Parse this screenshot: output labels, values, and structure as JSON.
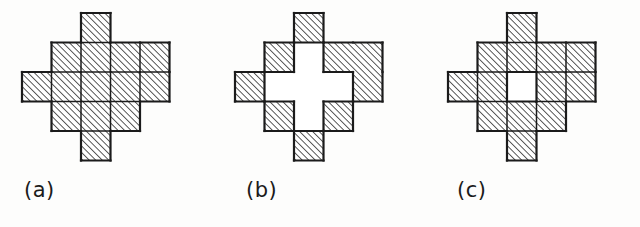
{
  "page": {
    "background_color": "#fdfdfc",
    "ink_color": "#1b1b1b",
    "hatch_color": "#2a2a2a",
    "fill_color": "#ffffff",
    "width": 640,
    "height": 227
  },
  "figure": {
    "grid": {
      "columns": 5,
      "rows": 5,
      "cell_size": 29.5,
      "hatch_angle_deg": 45,
      "hatch_spacing": 4.6,
      "hatch_direction": "lower-left-to-upper-right",
      "stroke_width": 2.2
    },
    "shape_cells": [
      [
        0,
        2
      ],
      [
        1,
        1
      ],
      [
        1,
        2
      ],
      [
        1,
        3
      ],
      [
        1,
        4
      ],
      [
        2,
        0
      ],
      [
        2,
        1
      ],
      [
        2,
        2
      ],
      [
        2,
        3
      ],
      [
        2,
        4
      ],
      [
        3,
        1
      ],
      [
        3,
        2
      ],
      [
        3,
        3
      ],
      [
        4,
        2
      ]
    ],
    "shape_cell_count": 14
  },
  "panels": [
    {
      "id": "a",
      "caption": "(a)",
      "hole_cells": [],
      "hole_cell_count": 0,
      "hole_shape": "none",
      "internal_grid_lines": true,
      "origin_x": 22,
      "origin_y": 13
    },
    {
      "id": "b",
      "caption": "(b)",
      "hole_cells": [
        [
          1,
          2
        ],
        [
          2,
          1
        ],
        [
          2,
          2
        ],
        [
          2,
          3
        ],
        [
          3,
          2
        ]
      ],
      "hole_cell_count": 5,
      "hole_shape": "plus",
      "internal_grid_lines": false,
      "origin_x": 22,
      "origin_y": 13
    },
    {
      "id": "c",
      "caption": "(c)",
      "hole_cells": [
        [
          2,
          2
        ]
      ],
      "hole_cell_count": 1,
      "hole_shape": "single-cell",
      "internal_grid_lines": true,
      "origin_x": 22,
      "origin_y": 13
    }
  ]
}
